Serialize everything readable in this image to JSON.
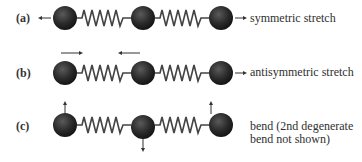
{
  "diagram": {
    "modes": [
      {
        "label": "(a)",
        "name": "symmetric stretch",
        "lines": [
          "symmetric stretch"
        ]
      },
      {
        "label": "(b)",
        "name": "antisymmetric stretch",
        "lines": [
          "antisymmetric stretch"
        ]
      },
      {
        "label": "(c)",
        "name": "bend (2nd degenerate bend not shown)",
        "lines": [
          "bend (2nd degenerate",
          "bend not shown)"
        ]
      }
    ],
    "colors": {
      "atom": "#2b2b2b",
      "spring": "#444444",
      "arrow": "#333333"
    }
  }
}
